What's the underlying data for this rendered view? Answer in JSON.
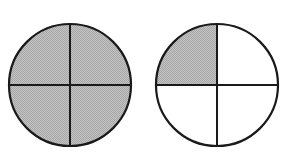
{
  "colors": {
    "stroke": "#1a1a1a",
    "shaded": "#b5b5b5",
    "unshaded": "#ffffff",
    "background": "#ffffff"
  },
  "figures": [
    {
      "name": "circle-whole",
      "parts": 4,
      "shaded_parts": 4,
      "fraction": "4/4",
      "shaded_quadrants": [
        "top-left",
        "top-right",
        "bottom-left",
        "bottom-right"
      ]
    },
    {
      "name": "circle-quarter",
      "parts": 4,
      "shaded_parts": 1,
      "fraction": "1/4",
      "shaded_quadrants": [
        "top-left"
      ]
    }
  ]
}
